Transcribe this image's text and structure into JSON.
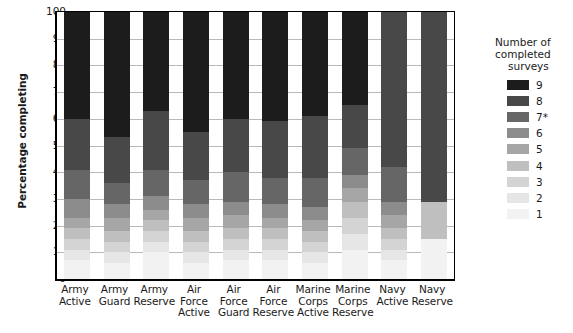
{
  "chart_data": {
    "type": "bar",
    "subtype": "stacked-bar-100",
    "title": "",
    "xlabel": "",
    "ylabel": "Percentage completing",
    "ylim": [
      0,
      100
    ],
    "yticks": [
      0,
      10,
      20,
      30,
      40,
      50,
      60,
      70,
      80,
      90,
      100
    ],
    "grid": true,
    "legend_position": "right",
    "legend_title": "Number of completed surveys",
    "categories": [
      "Army Active",
      "Army Guard",
      "Army Reserve",
      "Air Force Active",
      "Air Force Guard",
      "Air Force Reserve",
      "Marine Corps Active",
      "Marine Corps Reserve",
      "Navy Active",
      "Navy Reserve"
    ],
    "category_lines": [
      [
        "Army",
        "Active"
      ],
      [
        "Army",
        "Guard"
      ],
      [
        "Army",
        "Reserve"
      ],
      [
        "Air",
        "Force",
        "Active"
      ],
      [
        "Air",
        "Force",
        "Guard"
      ],
      [
        "Air",
        "Force",
        "Reserve"
      ],
      [
        "Marine",
        "Corps",
        "Active"
      ],
      [
        "Marine",
        "Corps",
        "Reserve"
      ],
      [
        "Navy",
        "Active"
      ],
      [
        "Navy",
        "Reserve"
      ]
    ],
    "series": [
      {
        "name": "1",
        "color": "#f2f2f2",
        "values": [
          7,
          6,
          10,
          6,
          7,
          7,
          6,
          11,
          7,
          15
        ]
      },
      {
        "name": "2",
        "color": "#e6e6e6",
        "values": [
          4,
          4,
          4,
          4,
          4,
          4,
          4,
          6,
          4,
          0
        ]
      },
      {
        "name": "3",
        "color": "#d4d4d4",
        "values": [
          4,
          4,
          4,
          4,
          4,
          4,
          4,
          6,
          4,
          0
        ]
      },
      {
        "name": "4",
        "color": "#bfbfbf",
        "values": [
          4,
          4,
          4,
          4,
          4,
          4,
          4,
          6,
          4,
          14
        ]
      },
      {
        "name": "5",
        "color": "#a6a6a6",
        "values": [
          4,
          5,
          4,
          5,
          5,
          4,
          4,
          5,
          5,
          0
        ]
      },
      {
        "name": "6",
        "color": "#8c8c8c",
        "values": [
          7,
          5,
          5,
          5,
          5,
          5,
          5,
          5,
          5,
          0
        ]
      },
      {
        "name": "7*",
        "color": "#666666",
        "values": [
          11,
          8,
          10,
          9,
          11,
          10,
          11,
          10,
          13,
          0
        ]
      },
      {
        "name": "8",
        "color": "#484848",
        "values": [
          19,
          17,
          22,
          18,
          20,
          21,
          23,
          16,
          58,
          71
        ]
      },
      {
        "name": "9",
        "color": "#1c1c1c",
        "values": [
          40,
          47,
          37,
          45,
          40,
          41,
          39,
          35,
          0,
          0
        ]
      }
    ]
  }
}
